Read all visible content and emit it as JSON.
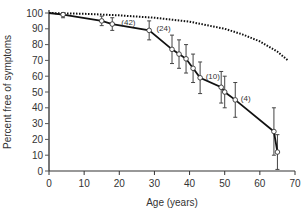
{
  "chart_data": {
    "type": "line",
    "title": "",
    "xlabel": "Age (years)",
    "ylabel": "Percent free of symptoms",
    "xlim": [
      0,
      70
    ],
    "ylim": [
      0,
      100
    ],
    "xticks": [
      0,
      10,
      20,
      30,
      40,
      50,
      60,
      70
    ],
    "yticks": [
      0,
      10,
      20,
      30,
      40,
      50,
      60,
      70,
      80,
      90,
      100
    ],
    "grid": false,
    "legend": null,
    "series": [
      {
        "name": "Observed",
        "style": "solid-with-open-circles-and-error-bars",
        "color": "#111111",
        "points": [
          {
            "x": 0,
            "y": 100,
            "err": 0
          },
          {
            "x": 4,
            "y": 99,
            "err": 2
          },
          {
            "x": 15,
            "y": 95,
            "err": 3
          },
          {
            "x": 18,
            "y": 93,
            "err": 4
          },
          {
            "x": 28.5,
            "y": 89,
            "err": 6
          },
          {
            "x": 35,
            "y": 77,
            "err": 9
          },
          {
            "x": 37,
            "y": 74,
            "err": 9
          },
          {
            "x": 39,
            "y": 71,
            "err": 9
          },
          {
            "x": 41,
            "y": 65,
            "err": 9
          },
          {
            "x": 43,
            "y": 59,
            "err": 10
          },
          {
            "x": 49,
            "y": 53,
            "err": 10
          },
          {
            "x": 50,
            "y": 50,
            "err": 10
          },
          {
            "x": 53,
            "y": 45,
            "err": 11
          },
          {
            "x": 64,
            "y": 25,
            "err": 15
          },
          {
            "x": 65,
            "y": 12,
            "err": 11
          }
        ]
      },
      {
        "name": "Expected (general population)",
        "style": "dotted",
        "color": "#111111",
        "points": [
          {
            "x": 0,
            "y": 100
          },
          {
            "x": 10,
            "y": 99.5
          },
          {
            "x": 20,
            "y": 98.5
          },
          {
            "x": 30,
            "y": 97
          },
          {
            "x": 40,
            "y": 94.5
          },
          {
            "x": 50,
            "y": 90
          },
          {
            "x": 55,
            "y": 86.5
          },
          {
            "x": 60,
            "y": 82
          },
          {
            "x": 65,
            "y": 75.5
          },
          {
            "x": 68,
            "y": 70
          }
        ]
      }
    ],
    "annotations": [
      {
        "text": "(42)",
        "x": 20,
        "y": 93
      },
      {
        "text": "(24)",
        "x": 30,
        "y": 89
      },
      {
        "text": "(10)",
        "x": 44,
        "y": 59
      },
      {
        "text": "(4)",
        "x": 54,
        "y": 45
      }
    ]
  }
}
